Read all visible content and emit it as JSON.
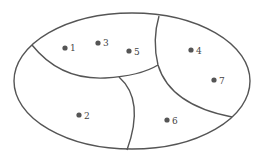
{
  "diagram": {
    "type": "region-partition",
    "stroke_color": "#555555",
    "point_color": "#555555",
    "outer_boundary": {
      "shape": "ellipse",
      "cx": 132,
      "cy": 81,
      "rx": 118,
      "ry": 68
    },
    "regions": [
      {
        "id": "top-left",
        "points": [
          "1",
          "3",
          "5"
        ]
      },
      {
        "id": "right",
        "points": [
          "4",
          "7"
        ]
      },
      {
        "id": "bottom-left",
        "points": [
          "2"
        ]
      },
      {
        "id": "bottom-middle",
        "points": [
          "6"
        ]
      }
    ],
    "points": [
      {
        "label": "1",
        "x": 65,
        "y": 48
      },
      {
        "label": "3",
        "x": 98,
        "y": 43
      },
      {
        "label": "5",
        "x": 129,
        "y": 51
      },
      {
        "label": "4",
        "x": 191,
        "y": 50
      },
      {
        "label": "7",
        "x": 214,
        "y": 80
      },
      {
        "label": "2",
        "x": 79,
        "y": 115
      },
      {
        "label": "6",
        "x": 167,
        "y": 120
      }
    ]
  }
}
